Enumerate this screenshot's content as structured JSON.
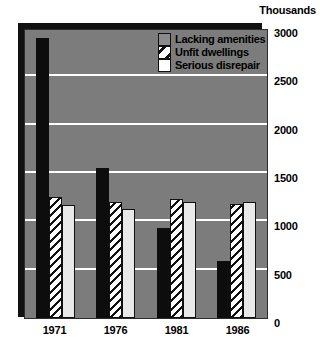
{
  "chart_data": {
    "type": "bar",
    "title": "",
    "subtitle": "",
    "units_label": "Thousands",
    "xlabel": "",
    "ylabel": "",
    "categories": [
      "1971",
      "1976",
      "1981",
      "1986"
    ],
    "series": [
      {
        "name": "Lacking amenities",
        "values": [
          2900,
          1550,
          930,
          590
        ],
        "swatch": "solid-black"
      },
      {
        "name": "Unfit dwellings",
        "values": [
          1250,
          1200,
          1230,
          1180
        ],
        "swatch": "diagonal-hatch"
      },
      {
        "name": "Serious disrepair",
        "values": [
          1170,
          1130,
          1200,
          1200
        ],
        "swatch": "white"
      }
    ],
    "ylim": [
      0,
      3000
    ],
    "yticks": [
      "3000",
      "2500",
      "2000",
      "1500",
      "1000",
      "500",
      "0"
    ],
    "ytick_values": [
      3000,
      2500,
      2000,
      1500,
      1000,
      500,
      0
    ],
    "grid": true,
    "gridlines_at": [
      2500,
      2000,
      1500,
      1000,
      500
    ],
    "legend_position": "top-right",
    "plot_background": "#7c7c7c",
    "gridline_color": "#ffffff"
  },
  "legend": {
    "items": [
      {
        "label": "Lacking amenities"
      },
      {
        "label": "Unfit dwellings"
      },
      {
        "label": "Serious disrepair"
      }
    ]
  }
}
